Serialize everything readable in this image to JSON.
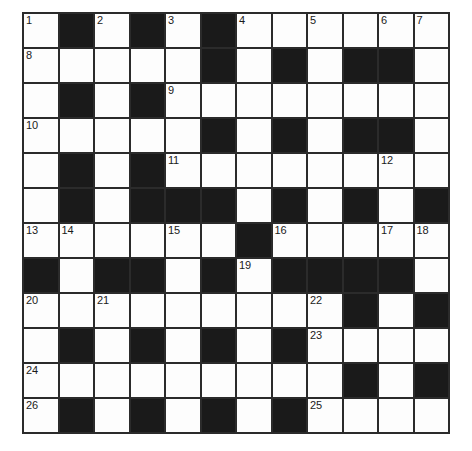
{
  "puzzle": {
    "type": "crossword-grid",
    "title": "",
    "rows": 12,
    "cols": 12,
    "colors": {
      "white_cell": "#fdfdfd",
      "black_cell": "#1a1a1a",
      "grid_line": "#2b2b2b",
      "number_text": "#1a1a1a",
      "page_background": "#ffffff"
    },
    "grid": [
      [
        "white",
        "black",
        "white",
        "black",
        "white",
        "black",
        "white",
        "white",
        "white",
        "white",
        "white",
        "white"
      ],
      [
        "white",
        "white",
        "white",
        "white",
        "white",
        "black",
        "white",
        "black",
        "white",
        "black",
        "black",
        "white"
      ],
      [
        "white",
        "black",
        "white",
        "black",
        "white",
        "white",
        "white",
        "white",
        "white",
        "white",
        "white",
        "white"
      ],
      [
        "white",
        "white",
        "white",
        "white",
        "white",
        "black",
        "white",
        "black",
        "white",
        "black",
        "black",
        "white"
      ],
      [
        "white",
        "black",
        "white",
        "black",
        "white",
        "white",
        "white",
        "white",
        "white",
        "white",
        "white",
        "white"
      ],
      [
        "white",
        "black",
        "white",
        "black",
        "black",
        "black",
        "white",
        "black",
        "white",
        "black",
        "white",
        "black"
      ],
      [
        "white",
        "white",
        "white",
        "white",
        "white",
        "white",
        "black",
        "white",
        "white",
        "white",
        "white",
        "white"
      ],
      [
        "black",
        "white",
        "black",
        "black",
        "white",
        "black",
        "white",
        "black",
        "black",
        "black",
        "black",
        "white"
      ],
      [
        "white",
        "white",
        "white",
        "white",
        "white",
        "white",
        "white",
        "white",
        "white",
        "black",
        "white",
        "black"
      ],
      [
        "white",
        "black",
        "white",
        "black",
        "white",
        "black",
        "white",
        "black",
        "white",
        "white",
        "white",
        "white"
      ],
      [
        "white",
        "white",
        "white",
        "white",
        "white",
        "white",
        "white",
        "white",
        "white",
        "black",
        "white",
        "black"
      ],
      [
        "white",
        "black",
        "white",
        "black",
        "white",
        "black",
        "white",
        "black",
        "white",
        "white",
        "white",
        "white"
      ]
    ],
    "numbers": [
      {
        "row": 0,
        "col": 0,
        "label": "1"
      },
      {
        "row": 0,
        "col": 2,
        "label": "2"
      },
      {
        "row": 0,
        "col": 4,
        "label": "3"
      },
      {
        "row": 0,
        "col": 6,
        "label": "4"
      },
      {
        "row": 0,
        "col": 8,
        "label": "5"
      },
      {
        "row": 0,
        "col": 10,
        "label": "6"
      },
      {
        "row": 0,
        "col": 11,
        "label": "7"
      },
      {
        "row": 1,
        "col": 0,
        "label": "8"
      },
      {
        "row": 2,
        "col": 4,
        "label": "9"
      },
      {
        "row": 3,
        "col": 0,
        "label": "10"
      },
      {
        "row": 4,
        "col": 4,
        "label": "11"
      },
      {
        "row": 4,
        "col": 10,
        "label": "12"
      },
      {
        "row": 6,
        "col": 0,
        "label": "13"
      },
      {
        "row": 6,
        "col": 1,
        "label": "14"
      },
      {
        "row": 6,
        "col": 4,
        "label": "15"
      },
      {
        "row": 6,
        "col": 7,
        "label": "16"
      },
      {
        "row": 6,
        "col": 10,
        "label": "17"
      },
      {
        "row": 6,
        "col": 11,
        "label": "18"
      },
      {
        "row": 7,
        "col": 6,
        "label": "19"
      },
      {
        "row": 8,
        "col": 0,
        "label": "20"
      },
      {
        "row": 8,
        "col": 2,
        "label": "21"
      },
      {
        "row": 8,
        "col": 8,
        "label": "22"
      },
      {
        "row": 9,
        "col": 8,
        "label": "23"
      },
      {
        "row": 10,
        "col": 0,
        "label": "24"
      },
      {
        "row": 11,
        "col": 8,
        "label": "25"
      },
      {
        "row": 11,
        "col": 0,
        "label": "26"
      }
    ],
    "letters": []
  }
}
